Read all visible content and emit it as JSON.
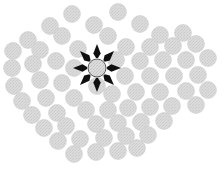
{
  "canvas": {
    "width": 224,
    "height": 173,
    "background_color": "#ffffff",
    "description": "Field of uniform light-gray textured discs arranged in a diamond-shaped cluster on a white background; the single central disc is marked by eight black arrows radiating outward from it."
  },
  "style": {
    "disc_fill": "#d8d8d8",
    "disc_stroke": "#cfcfcf",
    "disc_texture_fill": "#cccccc",
    "disc_radius": 8.4,
    "target_fill": "#d8d8d8",
    "target_stroke": "#555555",
    "arrow_color": "#101010",
    "arrow_count": 8,
    "arrow_inner_radius": 10,
    "arrow_outer_radius": 24,
    "arrow_half_width_deg": 5.5
  },
  "target": {
    "label": "highlighted-center-disc",
    "cx": 97,
    "cy": 68,
    "r": 9
  },
  "discs": [
    {
      "cx": 72,
      "cy": 14
    },
    {
      "cx": 118,
      "cy": 12
    },
    {
      "cx": 50,
      "cy": 26
    },
    {
      "cx": 94,
      "cy": 25
    },
    {
      "cx": 140,
      "cy": 24
    },
    {
      "cx": 28,
      "cy": 40
    },
    {
      "cx": 62,
      "cy": 36
    },
    {
      "cx": 108,
      "cy": 36
    },
    {
      "cx": 160,
      "cy": 35
    },
    {
      "cx": 183,
      "cy": 33
    },
    {
      "cx": 13,
      "cy": 51
    },
    {
      "cx": 40,
      "cy": 50
    },
    {
      "cx": 78,
      "cy": 49
    },
    {
      "cx": 126,
      "cy": 47
    },
    {
      "cx": 150,
      "cy": 47
    },
    {
      "cx": 173,
      "cy": 46
    },
    {
      "cx": 196,
      "cy": 44
    },
    {
      "cx": 12,
      "cy": 68
    },
    {
      "cx": 33,
      "cy": 64
    },
    {
      "cx": 56,
      "cy": 61
    },
    {
      "cx": 74,
      "cy": 68
    },
    {
      "cx": 116,
      "cy": 60
    },
    {
      "cx": 140,
      "cy": 61
    },
    {
      "cx": 163,
      "cy": 60
    },
    {
      "cx": 186,
      "cy": 60
    },
    {
      "cx": 208,
      "cy": 58
    },
    {
      "cx": 14,
      "cy": 86
    },
    {
      "cx": 40,
      "cy": 80
    },
    {
      "cx": 62,
      "cy": 83
    },
    {
      "cx": 97,
      "cy": 86
    },
    {
      "cx": 125,
      "cy": 76
    },
    {
      "cx": 150,
      "cy": 76
    },
    {
      "cx": 174,
      "cy": 76
    },
    {
      "cx": 198,
      "cy": 75
    },
    {
      "cx": 22,
      "cy": 101
    },
    {
      "cx": 46,
      "cy": 98
    },
    {
      "cx": 74,
      "cy": 98
    },
    {
      "cx": 112,
      "cy": 94
    },
    {
      "cx": 136,
      "cy": 92
    },
    {
      "cx": 160,
      "cy": 92
    },
    {
      "cx": 186,
      "cy": 91
    },
    {
      "cx": 208,
      "cy": 90
    },
    {
      "cx": 32,
      "cy": 115
    },
    {
      "cx": 57,
      "cy": 113
    },
    {
      "cx": 86,
      "cy": 110
    },
    {
      "cx": 108,
      "cy": 110
    },
    {
      "cx": 128,
      "cy": 108
    },
    {
      "cx": 150,
      "cy": 107
    },
    {
      "cx": 172,
      "cy": 106
    },
    {
      "cx": 196,
      "cy": 105
    },
    {
      "cx": 44,
      "cy": 128
    },
    {
      "cx": 66,
      "cy": 126
    },
    {
      "cx": 96,
      "cy": 124
    },
    {
      "cx": 118,
      "cy": 123
    },
    {
      "cx": 141,
      "cy": 122
    },
    {
      "cx": 164,
      "cy": 121
    },
    {
      "cx": 58,
      "cy": 141
    },
    {
      "cx": 80,
      "cy": 139
    },
    {
      "cx": 104,
      "cy": 138
    },
    {
      "cx": 126,
      "cy": 136
    },
    {
      "cx": 148,
      "cy": 135
    },
    {
      "cx": 74,
      "cy": 154
    },
    {
      "cx": 96,
      "cy": 152
    },
    {
      "cx": 118,
      "cy": 151
    },
    {
      "cx": 137,
      "cy": 148
    }
  ]
}
